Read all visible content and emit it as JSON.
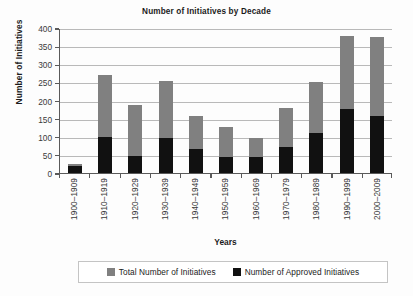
{
  "chart_data": {
    "type": "bar",
    "subtype": "stacked-overlay",
    "title": "Number of Initiatives by Decade",
    "xlabel": "Years",
    "ylabel": "Number of Initiatives",
    "ylim": [
      0,
      400
    ],
    "yticks": [
      0,
      50,
      100,
      150,
      200,
      250,
      300,
      350,
      400
    ],
    "ytick_labels": [
      "0",
      "50",
      "100",
      "150",
      "200",
      "250",
      "300",
      "350",
      "400"
    ],
    "grid": true,
    "grid_axis": "y",
    "legend_position": "bottom",
    "categories": [
      "1900–1909",
      "1910–1919",
      "1920–1929",
      "1930–1939",
      "1940–1949",
      "1950–1959",
      "1960–1969",
      "1970–1979",
      "1980–1989",
      "1990–1999",
      "2000–2009"
    ],
    "series": [
      {
        "name": "Total Number of Initiatives",
        "color": "#808080",
        "values": [
          25,
          270,
          188,
          253,
          157,
          126,
          96,
          180,
          250,
          379,
          375
        ]
      },
      {
        "name": "Number of Approved Initiatives",
        "color": "#111111",
        "values": [
          20,
          100,
          48,
          97,
          67,
          43,
          44,
          73,
          110,
          176,
          158
        ]
      }
    ]
  },
  "legend": {
    "items": [
      {
        "label": "Total Number of Initiatives",
        "color": "#808080"
      },
      {
        "label": "Number of Approved Initiatives",
        "color": "#111111"
      }
    ]
  }
}
